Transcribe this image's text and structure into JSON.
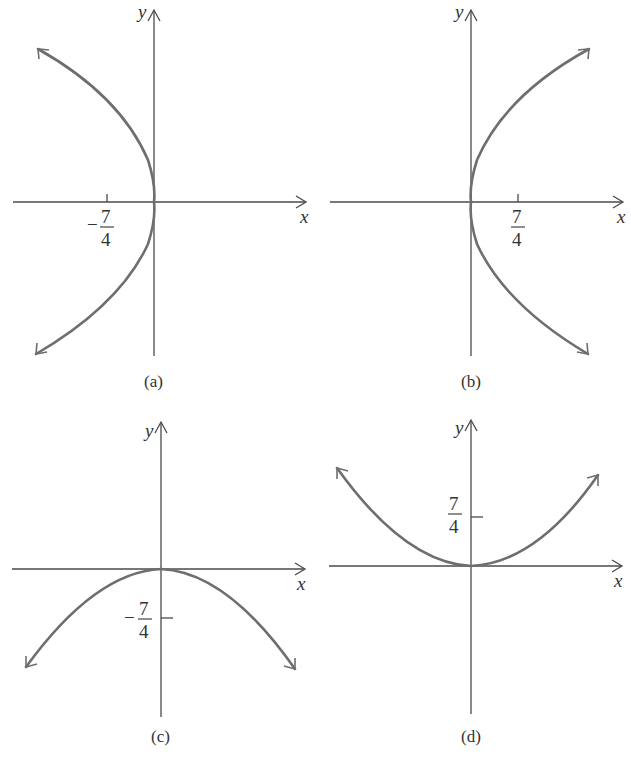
{
  "figure": {
    "panels": [
      {
        "id": "a",
        "caption": "(a)",
        "x_label": "x",
        "y_label": "y",
        "tick": {
          "axis": "x",
          "sign": "−",
          "numerator": "7",
          "denominator": "4",
          "value": -1.75
        },
        "curve": "parabola opening left, vertex at origin",
        "equation_form": "y^2 = -7x"
      },
      {
        "id": "b",
        "caption": "(b)",
        "x_label": "x",
        "y_label": "y",
        "tick": {
          "axis": "x",
          "sign": "",
          "numerator": "7",
          "denominator": "4",
          "value": 1.75
        },
        "curve": "parabola opening right, vertex at origin",
        "equation_form": "y^2 = 7x"
      },
      {
        "id": "c",
        "caption": "(c)",
        "x_label": "x",
        "y_label": "y",
        "tick": {
          "axis": "y",
          "sign": "−",
          "numerator": "7",
          "denominator": "4",
          "value": -1.75
        },
        "curve": "parabola opening downward, vertex at origin",
        "equation_form": "x^2 = -7y"
      },
      {
        "id": "d",
        "caption": "(d)",
        "x_label": "x",
        "y_label": "y",
        "tick": {
          "axis": "y",
          "sign": "",
          "numerator": "7",
          "denominator": "4",
          "value": 1.75
        },
        "curve": "parabola opening upward, vertex at origin",
        "equation_form": "x^2 = 7y"
      }
    ]
  },
  "colors": {
    "axis": "#4a4a4a",
    "curve": "#6e6e6e",
    "text": "#333333",
    "background": "#ffffff"
  }
}
